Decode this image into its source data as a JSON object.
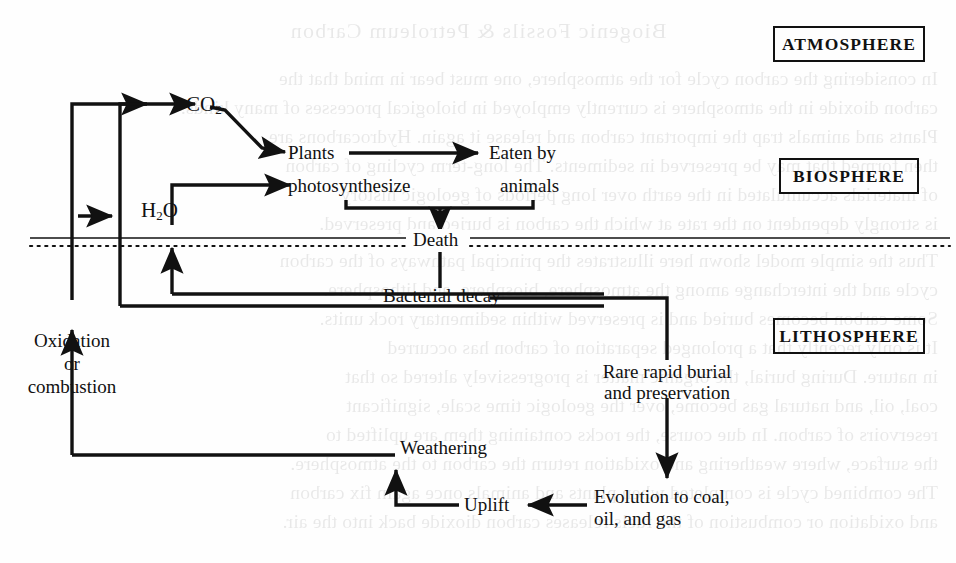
{
  "page": {
    "width": 956,
    "height": 563,
    "background_color": "#fefefe",
    "ink_color": "#111111",
    "bleed_through_text": [
      "Biogenic Fossils & Petroleum Carbon",
      "In considering the carbon cycle for the atmosphere, one must bear in mind that the",
      "carbon dioxide in the atmosphere is currently employed in biological processes of many kinds.",
      "Plants and animals trap the important carbon and release it again. Hydrocarbons are",
      "then formed that may be preserved in sediments. The long-term cycling of carbon",
      "of materials accumulated in the earth over long periods of geologic history",
      "is strongly dependent on the rate at which the carbon is buried and preserved.",
      "Thus the simple model shown here illustrates the principal pathways of the carbon",
      "cycle and the interchange among the atmosphere, biosphere, and lithosphere.",
      "Some carbon becomes buried and is preserved within sedimentary rock units.",
      "It is only recently that a prolonged separation of carbon has occurred",
      "in nature. During burial, the organic matter is progressively altered so that",
      "coal, oil, and natural gas become, over the geologic time scale, significant",
      "reservoirs of carbon. In due course, the rocks containing them are uplifted to",
      "the surface, where weathering and oxidation return the carbon to the atmosphere.",
      "The combined cycle is completed when plants and animals once again fix carbon",
      "and oxidation or combustion of the fuels releases carbon dioxide back into the air."
    ]
  },
  "diagram": {
    "sphere_labels": [
      {
        "id": "atmosphere",
        "text": "ATMOSPHERE"
      },
      {
        "id": "biosphere",
        "text": "BIOSPHERE"
      },
      {
        "id": "lithosphere",
        "text": "LITHOSPHERE"
      }
    ],
    "nodes": [
      {
        "id": "co2",
        "text": "CO",
        "subscript": "2"
      },
      {
        "id": "plants",
        "text": "Plants"
      },
      {
        "id": "photosynthesize",
        "text": "photosynthesize"
      },
      {
        "id": "eaten-by-animals",
        "line1": "Eaten by",
        "line2": "animals"
      },
      {
        "id": "h2o",
        "text": "H",
        "subscript": "2",
        "text2": "O"
      },
      {
        "id": "death",
        "text": "Death"
      },
      {
        "id": "bacterial-decay",
        "text": "Bacterial decay"
      },
      {
        "id": "oxidation-or-combustion",
        "line1": "Oxidation",
        "line2": "or",
        "line3": "combustion"
      },
      {
        "id": "rare-rapid-burial",
        "line1": "Rare rapid burial",
        "line2": "and preservation"
      },
      {
        "id": "weathering",
        "text": "Weathering"
      },
      {
        "id": "uplift",
        "text": "Uplift"
      },
      {
        "id": "evolution-to-coal",
        "line1": "Evolution to coal,",
        "line2": "oil, and gas"
      }
    ],
    "boundary": {
      "style": "solid line over dotted line",
      "label": "Death",
      "separates": "biosphere from lithosphere"
    },
    "flows": [
      "CO2 -> Plants",
      "H2O -> photosynthesize",
      "Plants -> Eaten by animals",
      "Plants + animals -> Death",
      "Death -> Bacterial decay",
      "Bacterial decay -> CO2",
      "Bacterial decay -> H2O",
      "Bacterial decay -> Rare rapid burial and preservation",
      "Rare rapid burial and preservation -> Evolution to coal, oil, and gas",
      "Evolution to coal, oil, and gas -> Uplift",
      "Uplift -> Weathering",
      "Weathering -> Oxidation or combustion",
      "Oxidation or combustion -> CO2"
    ]
  }
}
